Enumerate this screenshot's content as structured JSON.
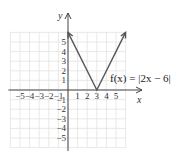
{
  "chart_data": {
    "type": "line",
    "title": "",
    "xlabel": "x",
    "ylabel": "y",
    "xlim": [
      -6,
      6
    ],
    "ylim": [
      -6,
      6
    ],
    "grid": true,
    "x_ticks": [
      "-5",
      "-4",
      "-3",
      "-2",
      "-1",
      "1",
      "2",
      "3",
      "4",
      "5"
    ],
    "y_ticks": [
      "5",
      "4",
      "3",
      "2",
      "1",
      "-1",
      "-2",
      "-3",
      "-4",
      "-5"
    ],
    "series": [
      {
        "name": "f(x) = |2x − 6|",
        "points": [
          [
            0,
            6
          ],
          [
            3,
            0
          ],
          [
            6,
            6
          ]
        ],
        "color": "#555555"
      }
    ],
    "annotations": [
      {
        "text": "f(x) = |2x − 6|",
        "x": 4.5,
        "y": 2
      }
    ]
  },
  "labels": {
    "x_axis": "x",
    "y_axis": "y",
    "equation": "f(x) = |2x − 6|"
  }
}
